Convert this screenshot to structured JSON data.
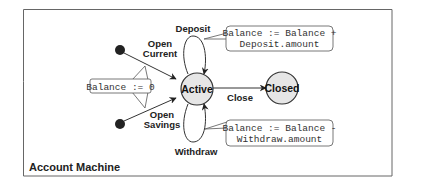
{
  "diagram": {
    "title": "Account Machine",
    "states": [
      {
        "id": "active",
        "label": "Active"
      },
      {
        "id": "closed",
        "label": "Closed"
      }
    ],
    "initial_states": [
      {
        "id": "init-current"
      },
      {
        "id": "init-savings"
      }
    ],
    "transitions": {
      "open_current": {
        "line1": "Open",
        "line2": "Current"
      },
      "open_savings": {
        "line1": "Open",
        "line2": "Savings"
      },
      "deposit": "Deposit",
      "withdraw": "Withdraw",
      "close": "Close"
    },
    "notes": {
      "open": "Balance := 0",
      "deposit_line1": "Balance :=  Balance +",
      "deposit_line2": "Deposit.amount",
      "withdraw_line1": "Balance := Balance -",
      "withdraw_line2": "Withdraw.amount"
    },
    "colors": {
      "state_fill": "#e6e6e6",
      "stroke": "#333333",
      "initial_fill": "#222222",
      "frame": "#666666"
    }
  }
}
